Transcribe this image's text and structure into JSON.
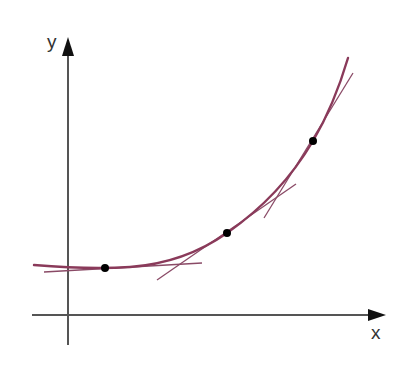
{
  "diagram": {
    "type": "function-with-tangents",
    "axes": {
      "x_label": "x",
      "y_label": "y",
      "color": "#555555"
    },
    "curve": {
      "description": "exponential-like increasing convex curve",
      "color": "#8a3a5a"
    },
    "tangent_color": "#8a4a66",
    "point_color": "#000000",
    "points": [
      {
        "name": "P1",
        "x": 105,
        "y": 268
      },
      {
        "name": "P2",
        "x": 227,
        "y": 233
      },
      {
        "name": "P3",
        "x": 313,
        "y": 141
      }
    ]
  }
}
